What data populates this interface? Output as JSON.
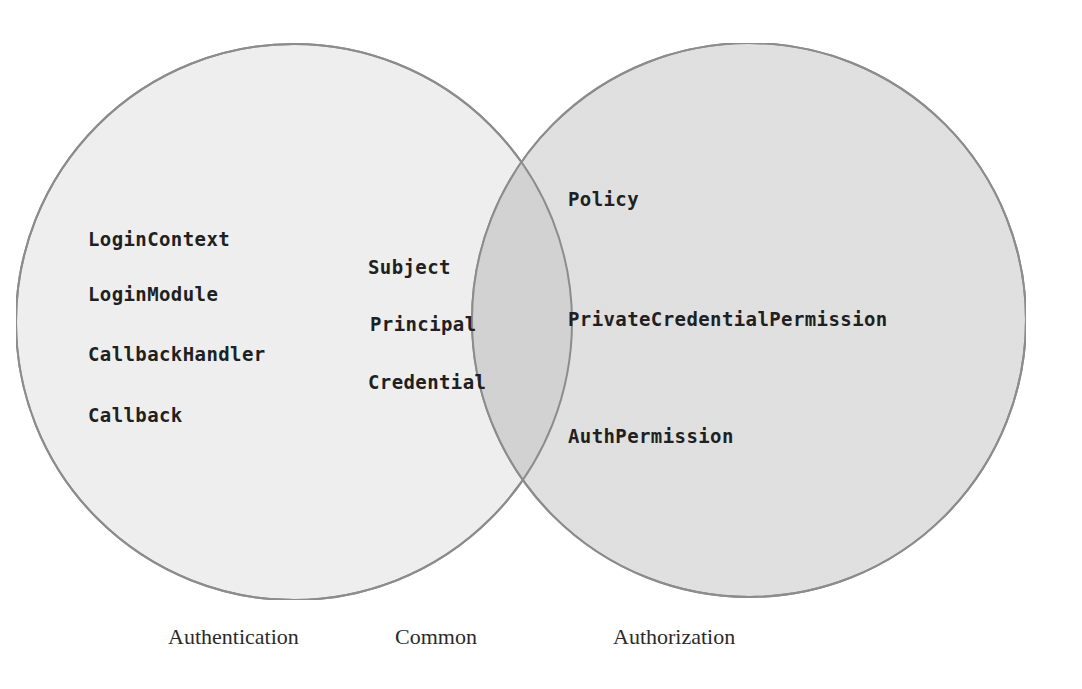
{
  "diagram": {
    "type": "venn",
    "sets": [
      {
        "id": "authentication",
        "caption": "Authentication",
        "fill": "#efefef",
        "stroke": "#8d8d8d",
        "cx": 294,
        "cy": 322,
        "r": 278,
        "members": [
          "LoginContext",
          "LoginModule",
          "CallbackHandler",
          "Callback"
        ]
      },
      {
        "id": "authorization",
        "caption": "Authorization",
        "fill": "#e1e1e1",
        "stroke": "#8d8d8d",
        "cx": 749,
        "cy": 320,
        "r": 277,
        "members": [
          "Policy",
          "PrivateCredentialPermission",
          "AuthPermission"
        ]
      }
    ],
    "intersection": {
      "id": "common",
      "caption": "Common",
      "fill": "#d3d3d3",
      "members": [
        "Subject",
        "Principal",
        "Credential"
      ]
    },
    "background": "#ffffff",
    "text_color": "#211f1f",
    "caption_color": "#2b2a2a"
  },
  "left_items": [
    {
      "text": "LoginContext",
      "x": 88,
      "y": 228
    },
    {
      "text": "LoginModule",
      "x": 88,
      "y": 283
    },
    {
      "text": "CallbackHandler",
      "x": 88,
      "y": 343
    },
    {
      "text": "Callback",
      "x": 88,
      "y": 404
    }
  ],
  "common_items": [
    {
      "text": "Subject",
      "x": 368,
      "y": 256
    },
    {
      "text": "Principal",
      "x": 370,
      "y": 313
    },
    {
      "text": "Credential",
      "x": 368,
      "y": 371
    }
  ],
  "right_items": [
    {
      "text": "Policy",
      "x": 568,
      "y": 188
    },
    {
      "text": "PrivateCredentialPermission",
      "x": 568,
      "y": 308
    },
    {
      "text": "AuthPermission",
      "x": 568,
      "y": 425
    }
  ],
  "captions": [
    {
      "text": "Authentication",
      "x": 168,
      "y": 624
    },
    {
      "text": "Common",
      "x": 395,
      "y": 624
    },
    {
      "text": "Authorization",
      "x": 613,
      "y": 624
    }
  ]
}
